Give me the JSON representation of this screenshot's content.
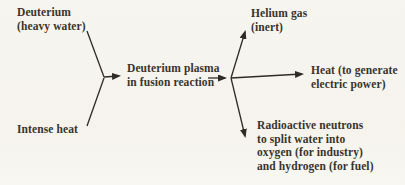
{
  "colors": {
    "ink": "#39342c",
    "line": "#2f2b25",
    "background": "#f6f4ee"
  },
  "nodes": {
    "deuterium": {
      "line1": "Deuterium",
      "line2": "(heavy water)"
    },
    "intense_heat": {
      "label": "Intense heat"
    },
    "plasma": {
      "line1": "Deuterium plasma",
      "line2": "in fusion reaction"
    },
    "helium": {
      "line1": "Helium gas",
      "line2": "(inert)"
    },
    "heat_out": {
      "line1": "Heat (to generate",
      "line2": "electric power)"
    },
    "neutrons": {
      "line1": "Radioactive neutrons",
      "line2": "to split water into",
      "line3": "oxygen (for industry)",
      "line4": "and hydrogen (for fuel)"
    }
  },
  "edges": [
    {
      "from": "Deuterium (heavy water)",
      "to": "Deuterium plasma in fusion reaction"
    },
    {
      "from": "Intense heat",
      "to": "Deuterium plasma in fusion reaction"
    },
    {
      "from": "Deuterium plasma in fusion reaction",
      "to": "Helium gas (inert)"
    },
    {
      "from": "Deuterium plasma in fusion reaction",
      "to": "Heat (to generate electric power)"
    },
    {
      "from": "Deuterium plasma in fusion reaction",
      "to": "Radioactive neutrons to split water into oxygen (for industry) and hydrogen (for fuel)"
    }
  ]
}
